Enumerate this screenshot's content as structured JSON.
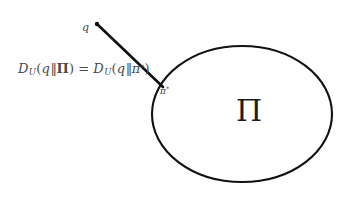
{
  "figure": {
    "background_color": "#ffffff",
    "stroke_color": "#111111",
    "text_color": "#3f3f3f",
    "width": 354,
    "height": 199
  },
  "labels": {
    "point_q": "q",
    "projection_point_pi": "π",
    "projection_point_star": "*",
    "set_pi": "Π"
  },
  "formula": {
    "full_text": "D_U(q‖Π) = D_U(q‖π*)",
    "lhs": {
      "divergence_symbol": "D",
      "subscript": "U",
      "open_paren": "(",
      "first_arg": "q",
      "separator": "‖",
      "second_arg": "Π",
      "close_paren": ")"
    },
    "relation": "=",
    "rhs": {
      "divergence_symbol": "D",
      "subscript": "U",
      "open_paren": "(",
      "first_arg": "q",
      "separator": "‖",
      "second_arg": "π",
      "second_arg_superscript": "*",
      "close_paren": ")"
    }
  },
  "geometry": {
    "ellipse": {
      "cx": 242,
      "cy": 114,
      "rx": 90,
      "ry": 68,
      "stroke_width": 2.1
    },
    "segment": {
      "x1": 97,
      "y1": 24,
      "x2": 163,
      "y2": 87,
      "stroke_width": 2.6
    },
    "endpoint_dot": {
      "cx": 97,
      "cy": 24,
      "r": 2.2
    }
  }
}
